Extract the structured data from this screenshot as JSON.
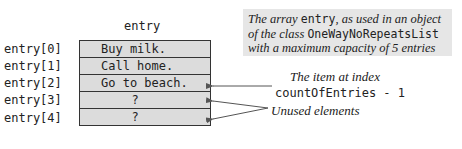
{
  "diagram": {
    "array_name": "entry",
    "index_labels": [
      "entry[0]",
      "entry[1]",
      "entry[2]",
      "entry[3]",
      "entry[4]"
    ],
    "cells": [
      "Buy milk.",
      "Call home.",
      "Go to beach.",
      "?",
      "?"
    ],
    "caption": {
      "part1": "The array ",
      "code1": "entry",
      "part2": ", as used in an object of the class ",
      "code2": "OneWayNoRepeatsList",
      "part3": " with a maximum capacity of 5 entries"
    },
    "annotations": {
      "last_item_line1": "The item at index",
      "last_item_line2": "countOfEntries - 1",
      "unused": "Unused elements"
    },
    "colors": {
      "cell_fill": "#dcdcdc",
      "caption_fill": "#e6e6e6",
      "border": "#333333",
      "arrow": "#555555"
    }
  }
}
